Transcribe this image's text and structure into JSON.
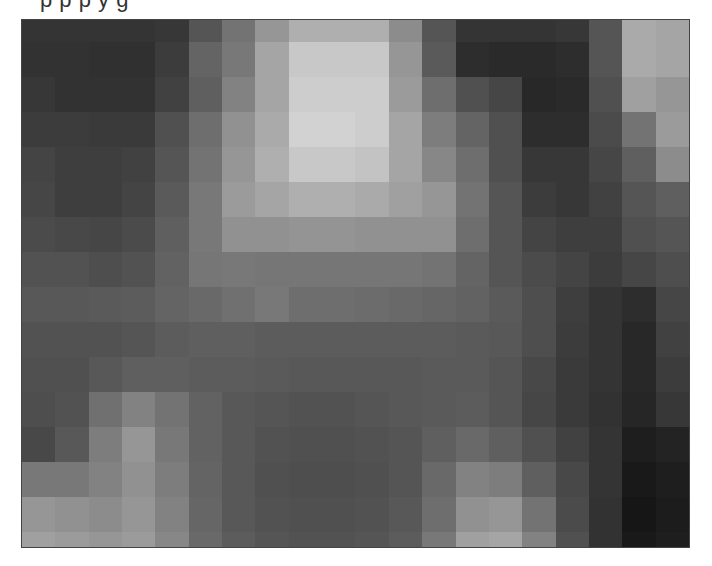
{
  "document": {
    "cut_text_line": "p                              p       p                          y     g"
  },
  "figure": {
    "columns": 20,
    "rows": 16,
    "gray_values": [
      [
        52,
        52,
        52,
        52,
        55,
        85,
        115,
        150,
        175,
        175,
        175,
        140,
        85,
        52,
        52,
        52,
        55,
        85,
        170,
        165
      ],
      [
        50,
        50,
        48,
        48,
        60,
        100,
        120,
        165,
        200,
        200,
        200,
        150,
        90,
        45,
        42,
        42,
        45,
        85,
        170,
        165
      ],
      [
        55,
        50,
        50,
        50,
        65,
        95,
        130,
        165,
        205,
        205,
        205,
        155,
        110,
        80,
        70,
        40,
        42,
        80,
        160,
        150
      ],
      [
        60,
        60,
        58,
        58,
        80,
        110,
        145,
        170,
        210,
        210,
        205,
        165,
        125,
        100,
        80,
        45,
        45,
        75,
        115,
        155
      ],
      [
        68,
        62,
        62,
        65,
        85,
        115,
        150,
        175,
        200,
        200,
        195,
        165,
        135,
        110,
        80,
        55,
        55,
        70,
        95,
        140
      ],
      [
        70,
        62,
        62,
        68,
        90,
        120,
        155,
        165,
        175,
        175,
        170,
        160,
        150,
        115,
        85,
        60,
        55,
        65,
        85,
        95
      ],
      [
        75,
        72,
        70,
        75,
        95,
        120,
        145,
        145,
        148,
        148,
        145,
        145,
        145,
        110,
        85,
        68,
        62,
        62,
        80,
        85
      ],
      [
        82,
        82,
        78,
        82,
        98,
        118,
        120,
        118,
        118,
        118,
        118,
        118,
        115,
        100,
        85,
        75,
        68,
        60,
        70,
        78
      ],
      [
        88,
        88,
        90,
        92,
        100,
        105,
        112,
        120,
        110,
        110,
        108,
        105,
        102,
        98,
        90,
        78,
        62,
        52,
        45,
        70
      ],
      [
        82,
        82,
        82,
        85,
        92,
        95,
        95,
        92,
        92,
        92,
        92,
        92,
        92,
        90,
        88,
        78,
        60,
        52,
        40,
        65
      ],
      [
        80,
        80,
        88,
        95,
        95,
        92,
        92,
        90,
        88,
        88,
        88,
        88,
        90,
        90,
        85,
        72,
        58,
        52,
        40,
        60
      ],
      [
        78,
        82,
        112,
        130,
        115,
        98,
        88,
        85,
        82,
        82,
        85,
        88,
        90,
        92,
        85,
        70,
        58,
        50,
        38,
        55
      ],
      [
        72,
        88,
        125,
        150,
        120,
        98,
        88,
        82,
        80,
        80,
        82,
        85,
        95,
        105,
        95,
        80,
        65,
        52,
        30,
        35
      ],
      [
        120,
        120,
        130,
        145,
        125,
        100,
        88,
        80,
        78,
        78,
        80,
        85,
        105,
        130,
        125,
        95,
        72,
        52,
        25,
        30
      ],
      [
        150,
        145,
        140,
        150,
        130,
        102,
        88,
        82,
        80,
        80,
        82,
        88,
        110,
        145,
        150,
        115,
        75,
        50,
        22,
        28
      ],
      [
        160,
        155,
        150,
        155,
        135,
        105,
        92,
        85,
        82,
        82,
        85,
        92,
        120,
        160,
        165,
        130,
        80,
        50,
        25,
        30
      ]
    ]
  }
}
